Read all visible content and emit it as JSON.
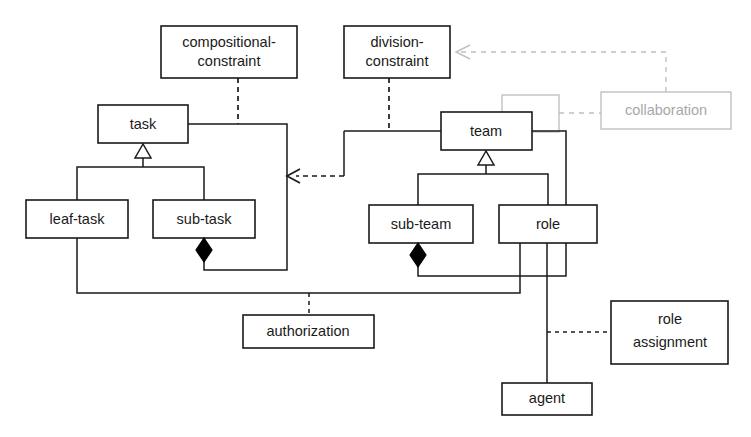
{
  "diagram": {
    "type": "uml-class-diagram",
    "colors": {
      "stroke": "#1a1a1a",
      "ghost_stroke": "#bcbcbc",
      "ghost_text": "#a8a8a8",
      "background": "#ffffff"
    },
    "top_clipped_text": "",
    "nodes": {
      "compositional_constraint": "compositional-\nconstraint",
      "compositional_constraint_line1": "compositional-",
      "compositional_constraint_line2": "constraint",
      "division_constraint_line1": "division-",
      "division_constraint_line2": "constraint",
      "collaboration": "collaboration",
      "task": "task",
      "team": "team",
      "leaf_task": "leaf-task",
      "sub_task": "sub-task",
      "sub_team": "sub-team",
      "role": "role",
      "authorization": "authorization",
      "role_assignment_line1": "role",
      "role_assignment_line2": "assignment",
      "agent": "agent"
    },
    "relationships": [
      {
        "from": "compositional-constraint",
        "to": "task",
        "style": "dashed",
        "kind": "constraint"
      },
      {
        "from": "division-constraint",
        "to": "team",
        "style": "dashed",
        "kind": "constraint"
      },
      {
        "from": "collaboration",
        "to": "division-constraint",
        "style": "dashed-arrow",
        "kind": "dependency"
      },
      {
        "from": "collaboration",
        "to": "team",
        "style": "dashed",
        "kind": "association"
      },
      {
        "from": "team-cluster",
        "to": "task-cluster",
        "style": "dashed-arrow",
        "kind": "dependency"
      },
      {
        "from": "leaf-task",
        "to": "task",
        "style": "generalization",
        "kind": "inheritance"
      },
      {
        "from": "sub-task",
        "to": "task",
        "style": "generalization",
        "kind": "inheritance"
      },
      {
        "from": "sub-team",
        "to": "team",
        "style": "generalization",
        "kind": "inheritance"
      },
      {
        "from": "role",
        "to": "team",
        "style": "generalization",
        "kind": "inheritance"
      },
      {
        "from": "task",
        "to": "sub-task",
        "style": "composition",
        "kind": "aggregation"
      },
      {
        "from": "team",
        "to": "sub-team",
        "style": "composition",
        "kind": "aggregation"
      },
      {
        "from": "authorization",
        "to": "leaf-task-role-link",
        "style": "dashed",
        "kind": "association-class"
      },
      {
        "from": "role-assignment",
        "to": "role-agent-link",
        "style": "dashed",
        "kind": "association-class"
      },
      {
        "from": "role",
        "to": "agent",
        "style": "solid",
        "kind": "association"
      }
    ]
  }
}
